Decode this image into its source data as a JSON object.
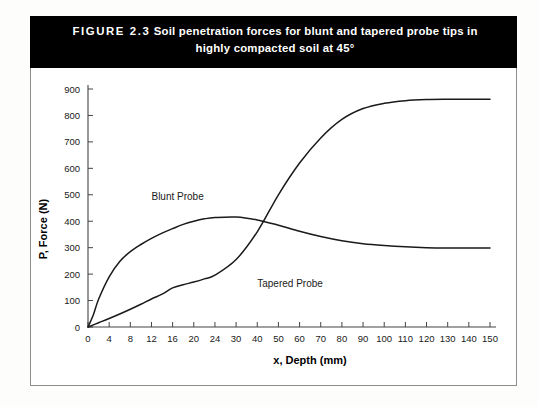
{
  "figure": {
    "number_label": "FIGURE 2.3",
    "caption_line1": "Soil penetration forces for blunt and tapered probe tips in",
    "caption_line2": "highly compacted soil at 45°",
    "title_bar_color": "#000000",
    "title_text_color": "#ffffff",
    "border_color": "#8e8e8e"
  },
  "chart_data": {
    "type": "line",
    "title": "Soil penetration forces for blunt and tapered probe tips in highly compacted soil at 45°",
    "xlabel": "x, Depth (mm)",
    "ylabel": "P, Force (N)",
    "xtick_labels": [
      "0",
      "4",
      "8",
      "12",
      "16",
      "20",
      "24",
      "30",
      "40",
      "50",
      "60",
      "70",
      "80",
      "90",
      "100",
      "110",
      "120",
      "130",
      "140",
      "150"
    ],
    "xtick_values": [
      0,
      4,
      8,
      12,
      16,
      20,
      24,
      30,
      40,
      50,
      60,
      70,
      80,
      90,
      100,
      110,
      120,
      130,
      140,
      150
    ],
    "x_axis_scale": "non-uniform (equal pixel spacing per labeled tick)",
    "ytick_labels": [
      "0",
      "100",
      "200",
      "300",
      "400",
      "500",
      "600",
      "700",
      "800",
      "900"
    ],
    "ytick_values": [
      0,
      100,
      200,
      300,
      400,
      500,
      600,
      700,
      800,
      900
    ],
    "ylim": [
      0,
      900
    ],
    "grid": false,
    "legend": "inline curve labels",
    "line_color": "#1a1a1a",
    "series": [
      {
        "name": "Blunt Probe",
        "label_position": {
          "x": 12,
          "y": 480
        },
        "points": [
          {
            "x": 0,
            "y": 0
          },
          {
            "x": 1,
            "y": 45
          },
          {
            "x": 2,
            "y": 105
          },
          {
            "x": 4,
            "y": 190
          },
          {
            "x": 6,
            "y": 248
          },
          {
            "x": 8,
            "y": 285
          },
          {
            "x": 10,
            "y": 312
          },
          {
            "x": 12,
            "y": 335
          },
          {
            "x": 14,
            "y": 355
          },
          {
            "x": 16,
            "y": 372
          },
          {
            "x": 18,
            "y": 388
          },
          {
            "x": 20,
            "y": 400
          },
          {
            "x": 22,
            "y": 409
          },
          {
            "x": 24,
            "y": 414
          },
          {
            "x": 30,
            "y": 416
          },
          {
            "x": 40,
            "y": 405
          },
          {
            "x": 50,
            "y": 385
          },
          {
            "x": 60,
            "y": 362
          },
          {
            "x": 70,
            "y": 342
          },
          {
            "x": 80,
            "y": 326
          },
          {
            "x": 90,
            "y": 315
          },
          {
            "x": 100,
            "y": 308
          },
          {
            "x": 110,
            "y": 303
          },
          {
            "x": 120,
            "y": 300
          },
          {
            "x": 130,
            "y": 299
          },
          {
            "x": 140,
            "y": 299
          },
          {
            "x": 150,
            "y": 299
          }
        ]
      },
      {
        "name": "Tapered Probe",
        "label_position": {
          "x": 40,
          "y": 150
        },
        "points": [
          {
            "x": 0,
            "y": 0
          },
          {
            "x": 2,
            "y": 16
          },
          {
            "x": 4,
            "y": 32
          },
          {
            "x": 6,
            "y": 49
          },
          {
            "x": 8,
            "y": 67
          },
          {
            "x": 10,
            "y": 86
          },
          {
            "x": 12,
            "y": 106
          },
          {
            "x": 14,
            "y": 124
          },
          {
            "x": 16,
            "y": 148
          },
          {
            "x": 18,
            "y": 160
          },
          {
            "x": 20,
            "y": 170
          },
          {
            "x": 22,
            "y": 182
          },
          {
            "x": 24,
            "y": 196
          },
          {
            "x": 30,
            "y": 255
          },
          {
            "x": 40,
            "y": 360
          },
          {
            "x": 50,
            "y": 500
          },
          {
            "x": 60,
            "y": 620
          },
          {
            "x": 70,
            "y": 715
          },
          {
            "x": 80,
            "y": 785
          },
          {
            "x": 90,
            "y": 826
          },
          {
            "x": 100,
            "y": 846
          },
          {
            "x": 110,
            "y": 856
          },
          {
            "x": 120,
            "y": 860
          },
          {
            "x": 130,
            "y": 861
          },
          {
            "x": 140,
            "y": 861
          },
          {
            "x": 150,
            "y": 861
          }
        ]
      }
    ]
  }
}
